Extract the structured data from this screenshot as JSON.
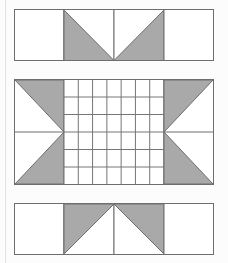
{
  "page": {
    "background_color": "#fcfcfc",
    "margin_rule_color": "#e3e3e3"
  },
  "palette": {
    "shaded_fill": "#a9a9a9",
    "white_fill": "#ffffff",
    "stroke": "#6e6e6e",
    "grid_stroke": "#767676"
  },
  "panels": [
    {
      "id": "panel-top",
      "name": "top-band",
      "columns": 4,
      "width": 200,
      "height": 52,
      "description": "Four equal cells: outer cells plain white, inner two cells each split by a diagonal forming a downward-pointing white triangle flanked by shaded triangles.",
      "cells": [
        {
          "index": 1,
          "fill": "white",
          "shape": "plain-rectangle"
        },
        {
          "index": 2,
          "fill": "shaded",
          "shape": "diagonal-tl-br",
          "shaded_side": "lower-left"
        },
        {
          "index": 3,
          "fill": "shaded",
          "shape": "diagonal-bl-tr",
          "shaded_side": "lower-right"
        },
        {
          "index": 4,
          "fill": "white",
          "shape": "plain-rectangle"
        }
      ]
    },
    {
      "id": "panel-middle",
      "name": "middle-band",
      "width": 200,
      "height": 106,
      "description": "Left and right end blocks each hold a white triangle whose apex meets the grid edge at mid-height, surrounded by shaded triangles; a rectangular lattice of squares fills the centre.",
      "grid": {
        "columns": 7,
        "rows": 6,
        "left": 0.25,
        "right": 0.75,
        "fill": "white"
      },
      "end_blocks": [
        {
          "side": "left",
          "apex": "right-middle",
          "shaded_regions": [
            "upper",
            "lower"
          ],
          "white_shape": "right-pointing-triangle"
        },
        {
          "side": "right",
          "apex": "left-middle",
          "shaded_regions": [
            "upper",
            "lower"
          ],
          "white_shape": "left-pointing-triangle"
        }
      ]
    },
    {
      "id": "panel-bottom",
      "name": "bottom-band",
      "columns": 4,
      "width": 200,
      "height": 52,
      "description": "Mirror of the top band: inner two cells form an upward-pointing white triangle flanked by shaded triangles, outer cells plain white.",
      "cells": [
        {
          "index": 1,
          "fill": "white",
          "shape": "plain-rectangle"
        },
        {
          "index": 2,
          "fill": "shaded",
          "shape": "diagonal-bl-tr",
          "shaded_side": "upper-left"
        },
        {
          "index": 3,
          "fill": "shaded",
          "shape": "diagonal-tl-br",
          "shaded_side": "upper-right"
        },
        {
          "index": 4,
          "fill": "white",
          "shape": "plain-rectangle"
        }
      ]
    }
  ]
}
